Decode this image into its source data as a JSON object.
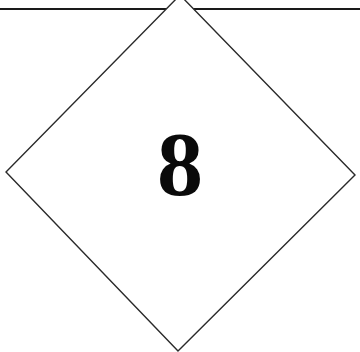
{
  "sign": {
    "shape": "diamond",
    "label": "8",
    "colors": {
      "background": "#ffffff",
      "stroke": "#1a1a1a",
      "text": "#0a0a0a"
    },
    "rule_line": {
      "y": 9
    }
  }
}
